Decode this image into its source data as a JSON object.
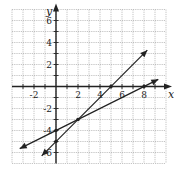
{
  "chart_data": {
    "type": "line",
    "title": "",
    "xlabel": "x",
    "ylabel": "y",
    "xlim": [
      -4,
      10
    ],
    "ylim": [
      -7,
      7
    ],
    "grid": true,
    "x_ticks": [
      -2,
      2,
      4,
      6,
      8
    ],
    "y_ticks": [
      6,
      4,
      2,
      -2,
      -4,
      -6
    ],
    "series": [
      {
        "name": "line-1",
        "equation": "y = x - 5",
        "slope": 1,
        "intercept": -5,
        "points": [
          [
            -1.3,
            -6.3
          ],
          [
            0,
            -5
          ],
          [
            2,
            -3
          ],
          [
            5,
            0
          ],
          [
            8.3,
            3.3
          ]
        ],
        "marked_points": [
          [
            0,
            -5
          ],
          [
            5,
            0
          ]
        ]
      },
      {
        "name": "line-2",
        "equation": "y = 0.5x - 4",
        "slope": 0.5,
        "intercept": -4,
        "points": [
          [
            -3.3,
            -5.65
          ],
          [
            0,
            -4
          ],
          [
            2,
            -3
          ],
          [
            8,
            0
          ],
          [
            9.3,
            0.65
          ]
        ],
        "marked_points": [
          [
            0,
            -4
          ],
          [
            8,
            0
          ]
        ]
      }
    ],
    "intersection": [
      2,
      -3
    ]
  },
  "labels": {
    "x_axis": "x",
    "y_axis": "y",
    "x_ticks": [
      "-2",
      "2",
      "4",
      "6",
      "8"
    ],
    "y_ticks": [
      "6",
      "4",
      "2",
      "-2",
      "-4",
      "-6"
    ]
  }
}
